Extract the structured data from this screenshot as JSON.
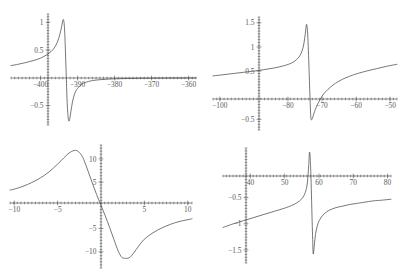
{
  "figure": {
    "title": "",
    "panel_count": 4,
    "background_color": "#ffffff",
    "curve_color": "#4a4a4a",
    "axis_color": "#585858"
  },
  "chart_data": [
    {
      "type": "line",
      "title": "",
      "xlabel": "",
      "ylabel": "",
      "grid": false,
      "legend": null,
      "xlim": [
        -408,
        -358
      ],
      "ylim": [
        -0.85,
        1.15
      ],
      "xticks": [
        -400,
        -390,
        -380,
        -370,
        -360
      ],
      "xticklabels": [
        "-400",
        "-390",
        "-380",
        "-370",
        "-360"
      ],
      "yticks": [
        -0.5,
        0.5,
        1
      ],
      "yticklabels": [
        "-0.5",
        "0.5",
        "1"
      ],
      "resonance_center": -393.2,
      "peak": {
        "x": -393.9,
        "y": 1.05
      },
      "trough": {
        "x": -392.3,
        "y": -0.78
      },
      "left_baseline": 0.22,
      "right_baseline": 0.0,
      "series": [
        {
          "name": "dispersion",
          "x": [
            -408,
            -406,
            -404,
            -402,
            -400,
            -398,
            -396.5,
            -395.5,
            -394.8,
            -394.3,
            -393.9,
            -393.6,
            -393.35,
            -393.1,
            -392.85,
            -392.6,
            -392.35,
            -392.1,
            -391.8,
            -391.4,
            -391,
            -390.5,
            -390,
            -389,
            -388,
            -386,
            -384,
            -382,
            -380,
            -376,
            -372,
            -368,
            -364,
            -360,
            -358
          ],
          "y": [
            0.22,
            0.245,
            0.275,
            0.31,
            0.355,
            0.43,
            0.52,
            0.64,
            0.78,
            0.93,
            1.05,
            0.95,
            0.6,
            0.1,
            -0.4,
            -0.68,
            -0.78,
            -0.73,
            -0.6,
            -0.44,
            -0.33,
            -0.24,
            -0.19,
            -0.12,
            -0.085,
            -0.05,
            -0.034,
            -0.024,
            -0.018,
            -0.011,
            -0.007,
            -0.005,
            -0.003,
            -0.002,
            -0.002
          ]
        }
      ]
    },
    {
      "type": "line",
      "title": "",
      "xlabel": "",
      "ylabel": "",
      "grid": false,
      "legend": null,
      "xlim": [
        -102,
        -48
      ],
      "ylim": [
        -0.72,
        1.62
      ],
      "xticks": [
        -100,
        -80,
        -70,
        -60,
        -50
      ],
      "xticklabels": [
        "-100",
        "-80",
        "-70",
        "-60",
        "-50"
      ],
      "yticks": [
        -0.5,
        0.5,
        1,
        1.5
      ],
      "yticklabels": [
        "-0.5",
        "0.5",
        "1",
        "1.5"
      ],
      "resonance_center": -74.5,
      "peak": {
        "x": -74.8,
        "y": 1.47
      },
      "trough": {
        "x": -73.3,
        "y": -0.51
      },
      "left_baseline": 0.4,
      "right_baseline": 0.62,
      "series": [
        {
          "name": "dispersion",
          "x": [
            -102,
            -99,
            -96,
            -93,
            -90,
            -87,
            -84,
            -81,
            -79,
            -77.5,
            -76.5,
            -75.8,
            -75.3,
            -74.9,
            -74.6,
            -74.35,
            -74.1,
            -73.9,
            -73.7,
            -73.5,
            -73.3,
            -73.1,
            -72.8,
            -72.4,
            -72,
            -71.4,
            -70.8,
            -70,
            -69,
            -67.5,
            -66,
            -64,
            -62,
            -60,
            -57,
            -54,
            -51,
            -48
          ],
          "y": [
            0.4,
            0.425,
            0.45,
            0.475,
            0.5,
            0.53,
            0.565,
            0.615,
            0.665,
            0.735,
            0.82,
            0.93,
            1.08,
            1.28,
            1.46,
            1.4,
            1.1,
            0.72,
            0.3,
            -0.12,
            -0.45,
            -0.51,
            -0.47,
            -0.38,
            -0.3,
            -0.2,
            -0.12,
            -0.02,
            0.07,
            0.17,
            0.25,
            0.33,
            0.39,
            0.44,
            0.5,
            0.55,
            0.6,
            0.64
          ]
        }
      ]
    },
    {
      "type": "line",
      "title": "",
      "xlabel": "",
      "ylabel": "",
      "grid": false,
      "legend": null,
      "xlim": [
        -10.5,
        10.5
      ],
      "ylim": [
        -13.5,
        13
      ],
      "xticks": [
        -10,
        -5,
        5,
        10
      ],
      "xticklabels": [
        "-10",
        "-5",
        "5",
        "10"
      ],
      "yticks": [
        -10,
        -5,
        5,
        10
      ],
      "yticklabels": [
        "-10",
        "-5",
        "5",
        "10"
      ],
      "resonance_center": 0,
      "peak": {
        "x": -2.8,
        "y": 11.8
      },
      "trough": {
        "x": 2.8,
        "y": -11.4
      },
      "left_baseline": 3.5,
      "right_baseline": -3.0,
      "series": [
        {
          "name": "dispersion",
          "x": [
            -10.5,
            -10,
            -9,
            -8,
            -7,
            -6,
            -5,
            -4.3,
            -3.8,
            -3.4,
            -3.1,
            -2.8,
            -2.4,
            -2,
            -1.5,
            -1,
            -0.5,
            0,
            0.5,
            1,
            1.5,
            2,
            2.4,
            2.8,
            3.1,
            3.4,
            3.8,
            4.3,
            5,
            6,
            7,
            8,
            9,
            10,
            10.5
          ],
          "y": [
            3.3,
            3.5,
            4.1,
            4.9,
            5.9,
            7.2,
            8.9,
            10.2,
            11.1,
            11.6,
            11.8,
            11.8,
            11.2,
            9.9,
            7.4,
            4.8,
            2.3,
            0.0,
            -2.3,
            -4.8,
            -7.4,
            -9.9,
            -11.2,
            -11.4,
            -11.4,
            -11.1,
            -10.2,
            -8.9,
            -7.3,
            -5.9,
            -4.9,
            -4.1,
            -3.5,
            -3.1,
            -2.9
          ]
        }
      ]
    },
    {
      "type": "line",
      "title": "",
      "xlabel": "",
      "ylabel": "",
      "grid": false,
      "legend": null,
      "xlim": [
        32,
        81
      ],
      "ylim": [
        -1.75,
        0.45
      ],
      "xticks": [
        40,
        50,
        60,
        70,
        80
      ],
      "xticklabels": [
        "40",
        "50",
        "60",
        "70",
        "80"
      ],
      "yticks": [
        -1.5,
        -1,
        -0.5
      ],
      "yticklabels": [
        "-1.5",
        "-1",
        "-0.5"
      ],
      "resonance_center": 57.5,
      "peak": {
        "x": 57.2,
        "y": 0.36
      },
      "trough": {
        "x": 58.3,
        "y": -1.57
      },
      "left_baseline": -1.07,
      "right_baseline": -0.53,
      "series": [
        {
          "name": "dispersion",
          "x": [
            32,
            35,
            38,
            41,
            44,
            47,
            50,
            52,
            53.5,
            55,
            56,
            56.6,
            57,
            57.2,
            57.4,
            57.6,
            57.8,
            58,
            58.15,
            58.3,
            58.5,
            58.8,
            59.2,
            59.8,
            60.5,
            61.5,
            63,
            65,
            67,
            69,
            71,
            73,
            76,
            78,
            81
          ],
          "y": [
            -1.07,
            -1.0,
            -0.94,
            -0.88,
            -0.82,
            -0.76,
            -0.7,
            -0.65,
            -0.6,
            -0.52,
            -0.4,
            -0.22,
            0.12,
            0.36,
            0.3,
            0.0,
            -0.45,
            -0.95,
            -1.3,
            -1.57,
            -1.5,
            -1.3,
            -1.12,
            -0.98,
            -0.89,
            -0.81,
            -0.74,
            -0.69,
            -0.66,
            -0.63,
            -0.61,
            -0.59,
            -0.56,
            -0.55,
            -0.53
          ]
        }
      ]
    }
  ]
}
